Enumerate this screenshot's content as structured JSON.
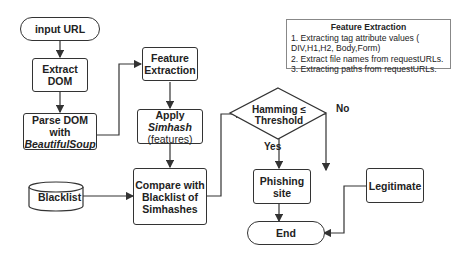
{
  "nodes": {
    "input_url": "input URL",
    "extract_dom_1": "Extract",
    "extract_dom_2": "DOM",
    "parse_dom_1": "Parse DOM with",
    "parse_dom_2": "BeautifulSoup",
    "feature_extraction_1": "Feature",
    "feature_extraction_2": "Extraction",
    "apply_simhash_1": "Apply",
    "apply_simhash_2": "Simhash",
    "apply_simhash_3": "(features)",
    "blacklist": "Blacklist",
    "compare_1": "Compare with",
    "compare_2": "Blacklist of",
    "compare_3": "Simhashes",
    "decision_1": "Hamming ≤",
    "decision_2": "Threshold",
    "phishing": "Phishing site",
    "legitimate": "Legitimate",
    "end": "End"
  },
  "edge_labels": {
    "yes": "Yes",
    "no": "No"
  },
  "note": {
    "title": "Feature Extraction",
    "items": [
      "1. Extracting tag attribute values ( DIV,H1,H2, Body,Form)",
      "2. Extract file names from requestURLs.",
      "3. Extracting paths from requestURLs."
    ]
  }
}
